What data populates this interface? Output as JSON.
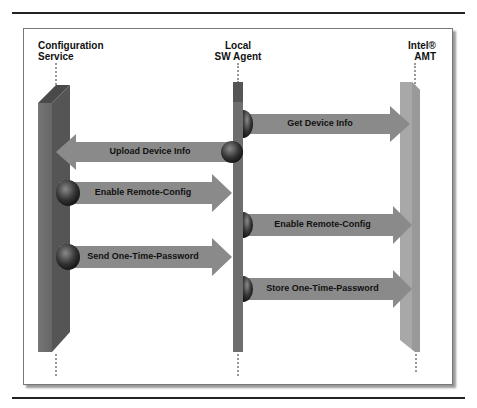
{
  "diagram": {
    "type": "sequence",
    "participants": [
      {
        "id": "config",
        "line1": "Configuration",
        "line2": "Service"
      },
      {
        "id": "agent",
        "line1": "Local",
        "line2": "SW Agent"
      },
      {
        "id": "amt",
        "line1": "Intel®",
        "line2": "AMT"
      }
    ],
    "messages": [
      {
        "label": "Get Device Info",
        "from": "agent",
        "to": "amt"
      },
      {
        "label": "Upload Device Info",
        "from": "agent",
        "to": "config"
      },
      {
        "label": "Enable Remote-Config",
        "from": "config",
        "to": "agent"
      },
      {
        "label": "Enable Remote-Config",
        "from": "agent",
        "to": "amt"
      },
      {
        "label": "Send One-Time-Password",
        "from": "config",
        "to": "agent"
      },
      {
        "label": "Store One-Time-Password",
        "from": "agent",
        "to": "amt"
      }
    ],
    "colors": {
      "config_pillar": "#6b6b6b",
      "agent_pillar": "#7a7a7a",
      "amt_pillar": "#a8a8a8",
      "arrow": "#8a8a8a",
      "sphere": "#3a3a3a"
    }
  }
}
